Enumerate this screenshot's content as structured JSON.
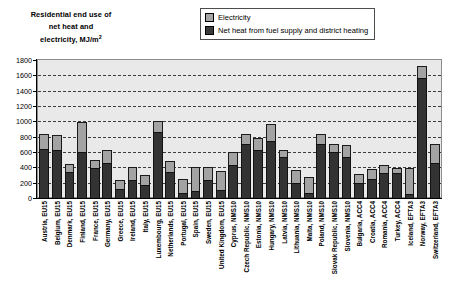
{
  "chart_data": {
    "type": "bar",
    "stacked": true,
    "title": "Residential end use of net heat and electricity, MJ/m2",
    "title_lines": [
      "Residential end use of",
      "net heat and",
      "electricity, MJ/m"
    ],
    "title_superscript": "2",
    "xlabel": "",
    "ylabel": "",
    "ylim": [
      0,
      1800
    ],
    "ytick_step": 200,
    "yticks": [
      1800,
      1600,
      1400,
      1200,
      1000,
      800,
      600,
      400,
      200,
      0
    ],
    "ytick_labels": [
      "1800",
      "1600",
      "1400",
      "1200",
      "1000",
      "800",
      "600",
      "400",
      "200",
      "0"
    ],
    "grid": true,
    "grid_style": "dashed-horizontal",
    "legend_position": "top-right",
    "categories": [
      "Austria, EU15",
      "Belgium, EU15",
      "Denmark, EU15",
      "Finland, EU15",
      "France, EU15",
      "Germany, EU15",
      "Greece, EU15",
      "Ireland, EU15",
      "Italy, EU15",
      "Luxembourg, EU15",
      "Netherlands, EU15",
      "Portugal, EU15",
      "Spain, EU15",
      "Sweden, EU15",
      "United Kingdom, EU15",
      "Cyprus, NMS10",
      "Czech Republic, NMS10",
      "Estonia, NMS10",
      "Hungary, NMS10",
      "Latvia, NMS10",
      "Lithuania, NMS10",
      "Malta, NMS10",
      "Poland, NMS10",
      "Slovak Republic, NMS10",
      "Slovenia, NMS10",
      "Bulgaria, ACC4",
      "Croatia, ACC4",
      "Romania, ACC4",
      "Turkey, ACC4",
      "Iceland, EFTA3",
      "Norway, EFTA3",
      "Switzerland, EFTA3"
    ],
    "series": [
      {
        "name": "Net heat from fuel supply and district heating",
        "color": "#333333",
        "values": [
          640,
          620,
          340,
          600,
          390,
          460,
          120,
          230,
          170,
          860,
          340,
          60,
          90,
          230,
          110,
          430,
          700,
          630,
          740,
          530,
          200,
          60,
          700,
          600,
          530,
          190,
          250,
          330,
          330,
          50,
          1570,
          460
        ]
      },
      {
        "name": "Electricity",
        "color": "#a3a3a3",
        "values": [
          200,
          200,
          110,
          390,
          110,
          170,
          120,
          170,
          130,
          140,
          140,
          190,
          320,
          170,
          240,
          170,
          130,
          150,
          220,
          90,
          160,
          210,
          130,
          100,
          160,
          120,
          130,
          100,
          60,
          340,
          150,
          240
        ]
      }
    ],
    "totals": [
      840,
      820,
      450,
      990,
      500,
      630,
      240,
      400,
      300,
      1000,
      480,
      250,
      410,
      400,
      350,
      600,
      830,
      780,
      960,
      620,
      360,
      270,
      830,
      700,
      690,
      310,
      380,
      430,
      390,
      390,
      1720,
      700
    ]
  },
  "legend": {
    "items": [
      {
        "label": "Electricity",
        "swatch": "legend-swatch-electricity"
      },
      {
        "label": "Net heat from fuel supply and district heating",
        "swatch": "legend-swatch-net-heat"
      }
    ]
  },
  "colors": {
    "electricity": "#a3a3a3",
    "net_heat": "#333333",
    "plot_background": "#e9e9e9",
    "gridline": "#3c3c3c",
    "axis": "#000000"
  }
}
